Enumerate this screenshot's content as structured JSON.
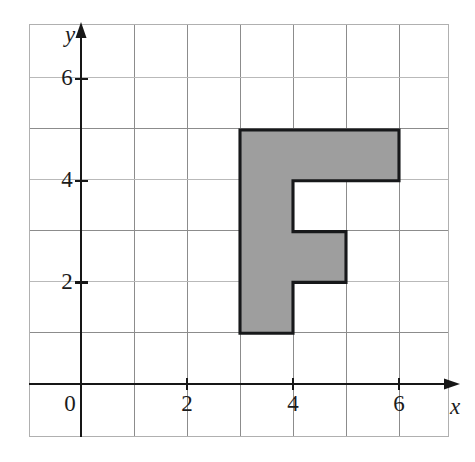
{
  "figure": {
    "kind": "coordinate-grid-shaded-polygon",
    "background_color": "#ffffff",
    "frame_color": "#b0b0b0",
    "grid_color": "#8c8c8c",
    "grid_color_faint": "#b9b9b9",
    "axis_color": "#171717",
    "shape_fill_color": "#9e9e9e",
    "shape_stroke_color": "#17181a"
  },
  "axes": {
    "x_axis_label": "x",
    "y_axis_label": "y",
    "origin_label": "0",
    "x_tick_labels": [
      "2",
      "4",
      "6"
    ],
    "y_tick_labels": [
      "2",
      "4",
      "6"
    ],
    "x_ticks": [
      2,
      4,
      6
    ],
    "y_ticks": [
      2,
      4,
      6
    ],
    "x_range": [
      -1,
      7
    ],
    "y_range": [
      -1,
      7
    ],
    "grid_step": 1
  },
  "chart_data": {
    "type": "scatter",
    "title": "",
    "xlabel": "x",
    "ylabel": "y",
    "xlim": [
      -1,
      7
    ],
    "ylim": [
      -1,
      7
    ],
    "grid": true,
    "legend": null,
    "x_tick_values": [
      0,
      2,
      4,
      6
    ],
    "y_tick_values": [
      0,
      2,
      4,
      6
    ],
    "x_tick_labels": [
      "0",
      "2",
      "4",
      "6"
    ],
    "y_tick_labels": [
      "0",
      "2",
      "4",
      "6"
    ],
    "shapes": [
      {
        "name": "shaded-f-polygon",
        "fill": "#9e9e9e",
        "stroke": "#17181a",
        "closed": true,
        "area_units": 9,
        "vertices": [
          [
            3,
            1
          ],
          [
            3,
            5
          ],
          [
            6,
            5
          ],
          [
            6,
            4
          ],
          [
            4,
            4
          ],
          [
            4,
            3
          ],
          [
            5,
            3
          ],
          [
            5,
            2
          ],
          [
            4,
            2
          ],
          [
            4,
            1
          ]
        ]
      }
    ]
  },
  "geometry_px": {
    "frame": {
      "left": 29,
      "top": 24,
      "right": 449,
      "bottom": 437
    },
    "origin": {
      "x": 81,
      "y": 384
    },
    "unit_x": 53,
    "unit_y": 50.8,
    "vertical_grid_x": [
      29,
      81,
      134,
      187,
      240,
      293,
      346,
      399,
      449
    ],
    "horizontal_grid_y": [
      24,
      77,
      128,
      179,
      230,
      281,
      332,
      384,
      437
    ]
  }
}
